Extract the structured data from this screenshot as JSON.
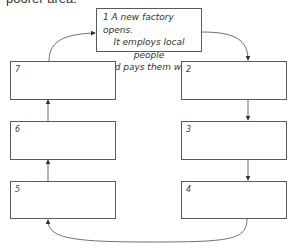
{
  "intro_text": "poorer area.",
  "top_box": {
    "number": "1",
    "lines": [
      "1 A new factory opens.",
      "It employs local people",
      "and pays them well."
    ]
  },
  "boxes": [
    {
      "id": "2",
      "label": "2",
      "text": ""
    },
    {
      "id": "3",
      "label": "3",
      "text": ""
    },
    {
      "id": "4",
      "label": "4",
      "text": ""
    },
    {
      "id": "5",
      "label": "5",
      "text": ""
    },
    {
      "id": "6",
      "label": "6",
      "text": ""
    },
    {
      "id": "7",
      "label": "7",
      "text": ""
    }
  ],
  "flow": [
    "1",
    "2",
    "3",
    "4",
    "5",
    "6",
    "7",
    "1"
  ],
  "colors": {
    "line": "#4a4a4a",
    "text": "#333333",
    "background": "#ffffff"
  }
}
